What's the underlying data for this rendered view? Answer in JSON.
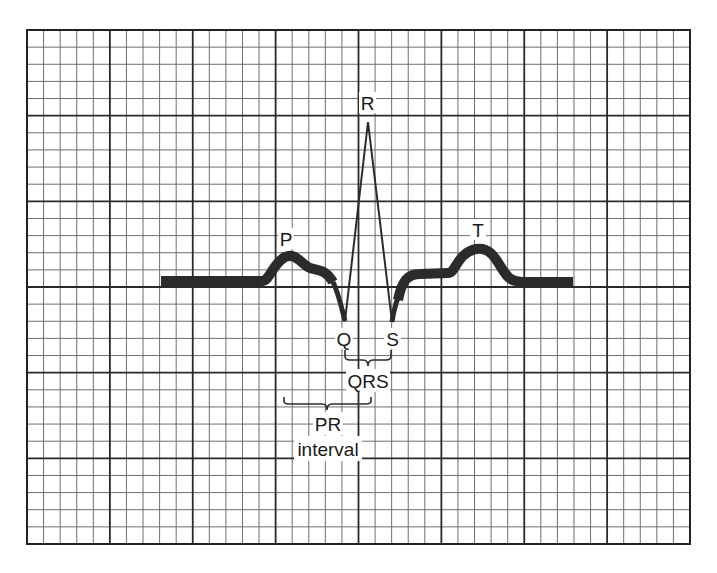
{
  "diagram": {
    "grid": {
      "x0": 27,
      "y0": 30,
      "x1": 690,
      "y1": 544,
      "major_cols": 8,
      "major_rows": 6,
      "minor_per_major": 5
    },
    "labels": {
      "p": "P",
      "q": "Q",
      "r": "R",
      "s": "S",
      "t": "T",
      "qrs": "QRS",
      "pr_line1": "PR",
      "pr_line2": "interval"
    },
    "waves": [
      "P wave",
      "QRS complex",
      "T wave"
    ],
    "intervals": [
      "QRS",
      "PR interval"
    ]
  }
}
